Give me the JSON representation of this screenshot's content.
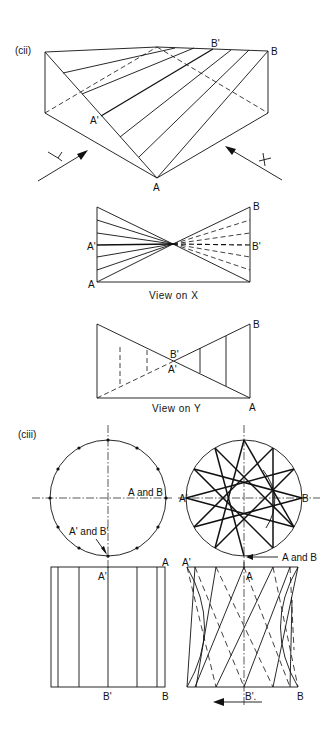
{
  "figure": {
    "part_cii": {
      "label": "(cii)",
      "isometric": {
        "points": {
          "A": "A",
          "A_prime": "A'",
          "B": "B",
          "B_prime": "B'"
        },
        "arrows": {
          "Y": "Y",
          "X": "X"
        }
      },
      "view_on_x": {
        "caption": "View on X",
        "labels": {
          "A": "A",
          "A_prime": "A'",
          "B": "B",
          "B_prime": "B'"
        }
      },
      "view_on_y": {
        "caption": "View on Y",
        "labels": {
          "A": "A",
          "A_prime": "A'",
          "B": "B",
          "B_prime": "B'"
        }
      }
    },
    "part_ciii": {
      "label": "(ciii)",
      "plan_left": {
        "label_ab": "A and B",
        "label_apbp": "A' and B'"
      },
      "plan_right": {
        "label_aprime": "A'",
        "label_b": "B",
        "label_ab": "A and B"
      },
      "elevation_left": {
        "label_a": "A",
        "label_aprime": "A'",
        "label_bprime": "B'",
        "label_b": "B"
      },
      "elevation_right": {
        "label_aprime": "A'",
        "label_a": "A",
        "label_bprime": "B'.",
        "label_b": "B"
      }
    }
  }
}
